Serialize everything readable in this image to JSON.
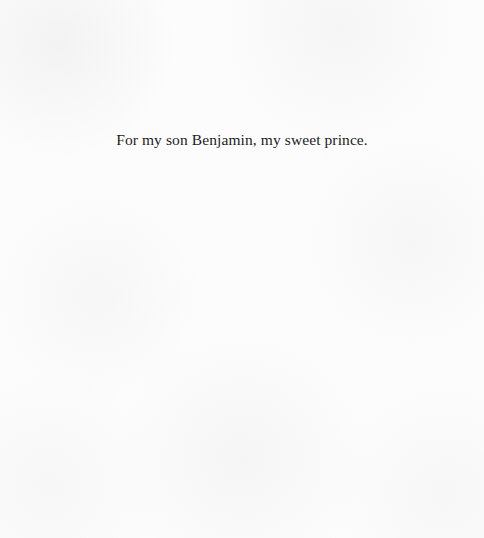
{
  "page": {
    "type": "dedication",
    "background_color": "#fcfcfc",
    "text_color": "#1c1c1c"
  },
  "dedication": {
    "text": "For my son Benjamin, my sweet prince."
  }
}
